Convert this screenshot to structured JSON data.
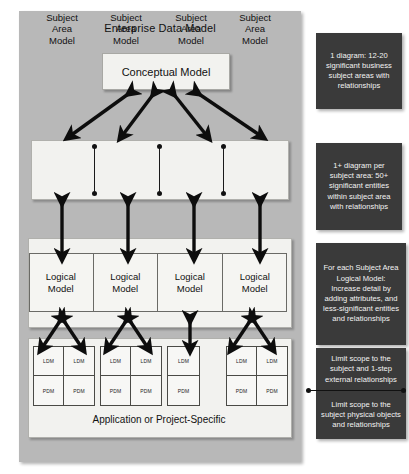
{
  "diagram": {
    "title": "Enterprise Data Model",
    "conceptual": {
      "label": "Conceptual Model"
    },
    "subject_area": {
      "line1": "Subject",
      "line2": "Area",
      "line3": "Model",
      "count": 4
    },
    "logical": {
      "line1": "Logical",
      "line2": "Model",
      "count": 4
    },
    "application": {
      "title": "Application or Project-Specific",
      "groups": [
        {
          "columns": 2,
          "cells": [
            "LDM",
            "LDM",
            "PDM",
            "PDM"
          ]
        },
        {
          "columns": 2,
          "cells": [
            "LDM",
            "LDM",
            "PDM",
            "PDM"
          ]
        },
        {
          "columns": 1,
          "cells": [
            "LDM",
            "PDM"
          ]
        },
        {
          "columns": 2,
          "cells": [
            "LDM",
            "LDM",
            "PDM",
            "PDM"
          ]
        }
      ]
    }
  },
  "callouts": [
    {
      "text": "1 diagram: 12-20 significant business subject areas with relationships"
    },
    {
      "text": "1+ diagram per subject area: 50+ significant entities within subject area with relationships"
    },
    {
      "text": "For each Subject Area Logical Model: Increase detail by adding attributes, and less-significant entities and relationships"
    },
    {
      "text": "Limit scope to the subject and 1-step external relationships"
    },
    {
      "text": "Limit scope to the subject physical objects and relationships"
    }
  ],
  "colors": {
    "outer_panel": "#b8b8b8",
    "box_fill": "#f2f2ef",
    "callout_bg": "#3a3a3a",
    "callout_text": "#f3f3f3",
    "arrow": "#0d0d0d",
    "page_bg": "#ffffff"
  }
}
